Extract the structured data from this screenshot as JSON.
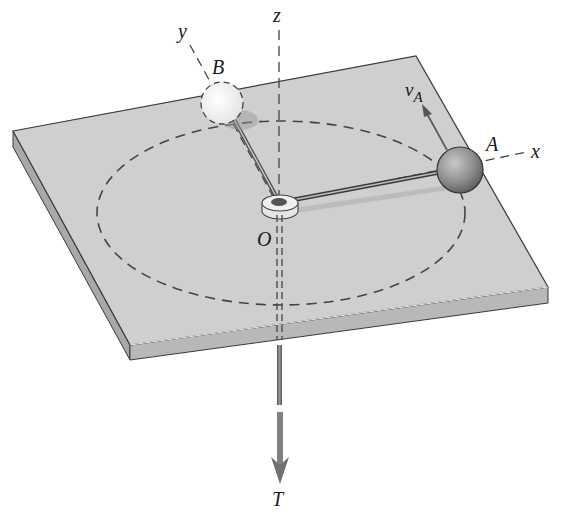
{
  "figure": {
    "labels": {
      "z_axis": "z",
      "y_axis": "y",
      "x_axis": "x",
      "point_b": "B",
      "point_a": "A",
      "origin": "O",
      "velocity": "v",
      "velocity_sub": "A",
      "tension": "T"
    },
    "colors": {
      "plate_top": "#cfcfcf",
      "plate_side_front": "#b4b4b4",
      "plate_side_left": "#a8a8a8",
      "edge": "#3a3a3a",
      "dashed": "#444444",
      "sphere_a": "#8e8e8e",
      "sphere_b": "#f4f4f4",
      "arrow": "#707070"
    }
  }
}
